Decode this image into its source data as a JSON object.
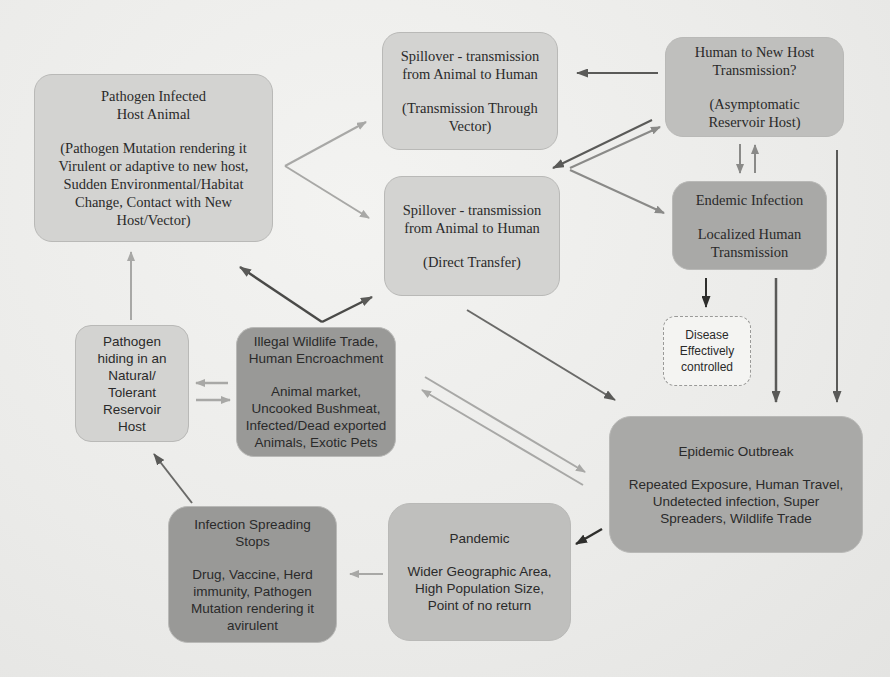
{
  "diagram": {
    "nodes": {
      "host_animal": {
        "title": [
          "Pathogen Infected",
          "Host Animal"
        ],
        "body": [
          "(Pathogen Mutation rendering it",
          "Virulent or adaptive to new host,",
          "Sudden Environmental/Habitat",
          "Change, Contact with New",
          "Host/Vector)"
        ]
      },
      "spillover_vector": {
        "title": [
          "Spillover - transmission",
          "from Animal to Human"
        ],
        "body": [
          "(Transmission Through",
          "Vector)"
        ]
      },
      "human_to_new_host": {
        "title": [
          "Human to New Host",
          "Transmission?"
        ],
        "body": [
          "(Asymptomatic",
          "Reservoir Host)"
        ]
      },
      "spillover_direct": {
        "title": [
          "Spillover - transmission",
          "from Animal to Human"
        ],
        "body": [
          "(Direct Transfer)"
        ]
      },
      "endemic": {
        "title": [
          "Endemic Infection"
        ],
        "body": [
          "Localized Human",
          "Transmission"
        ]
      },
      "reservoir_host": {
        "title": [
          "Pathogen",
          "hiding in an",
          "Natural/",
          "Tolerant",
          "Reservoir",
          "Host"
        ]
      },
      "illegal_trade": {
        "title": [
          "Illegal Wildlife Trade,",
          "Human Encroachment"
        ],
        "body": [
          "Animal market,",
          "Uncooked Bushmeat,",
          "Infected/Dead exported",
          "Animals, Exotic Pets"
        ]
      },
      "controlled": {
        "title": [
          "Disease",
          "Effectively",
          "controlled"
        ]
      },
      "epidemic": {
        "title": [
          "Epidemic Outbreak"
        ],
        "body": [
          "Repeated Exposure, Human Travel,",
          "Undetected infection, Super",
          "Spreaders, Wildlife Trade"
        ]
      },
      "pandemic": {
        "title": [
          "Pandemic"
        ],
        "body": [
          "Wider Geographic Area,",
          "High Population Size,",
          "Point of no return"
        ]
      },
      "spreading_stops": {
        "title": [
          "Infection Spreading",
          "Stops"
        ],
        "body": [
          "Drug, Vaccine, Herd",
          "immunity, Pathogen",
          "Mutation rendering it",
          "avirulent"
        ]
      }
    },
    "edges": [
      {
        "from": "host_animal",
        "to": "spillover_vector",
        "shade": "light"
      },
      {
        "from": "host_animal",
        "to": "spillover_direct",
        "shade": "light"
      },
      {
        "from": "human_to_new_host",
        "to": "spillover_vector",
        "shade": "dark"
      },
      {
        "from": "human_to_new_host",
        "to": "spillover_direct",
        "shade": "dark"
      },
      {
        "from": "spillover_direct",
        "to": "human_to_new_host",
        "shade": "mid"
      },
      {
        "from": "spillover_direct",
        "to": "endemic",
        "shade": "mid"
      },
      {
        "from": "human_to_new_host",
        "to": "endemic",
        "shade": "mid"
      },
      {
        "from": "endemic",
        "to": "human_to_new_host",
        "shade": "mid"
      },
      {
        "from": "human_to_new_host",
        "to": "epidemic",
        "shade": "dark"
      },
      {
        "from": "endemic",
        "to": "controlled",
        "shade": "dark"
      },
      {
        "from": "endemic",
        "to": "epidemic",
        "shade": "dark"
      },
      {
        "from": "illegal_trade",
        "to": "host_animal",
        "shade": "dark"
      },
      {
        "from": "illegal_trade",
        "to": "spillover_direct",
        "shade": "dark"
      },
      {
        "from": "spillover_direct",
        "to": "epidemic",
        "shade": "dark"
      },
      {
        "from": "illegal_trade",
        "to": "epidemic",
        "shade": "light"
      },
      {
        "from": "epidemic",
        "to": "illegal_trade",
        "shade": "light"
      },
      {
        "from": "illegal_trade",
        "to": "reservoir_host",
        "shade": "light"
      },
      {
        "from": "reservoir_host",
        "to": "illegal_trade",
        "shade": "light"
      },
      {
        "from": "reservoir_host",
        "to": "host_animal",
        "shade": "light"
      },
      {
        "from": "epidemic",
        "to": "pandemic",
        "shade": "darkest"
      },
      {
        "from": "pandemic",
        "to": "spreading_stops",
        "shade": "light"
      },
      {
        "from": "spreading_stops",
        "to": "reservoir_host",
        "shade": "dark"
      }
    ],
    "colors": {
      "background": "#ededeb",
      "node_light": "#d3d3d1",
      "node_mid": "#bfbfbd",
      "node_dark": "#a9a9a7",
      "node_darker": "#999997",
      "arrow_light": "#a8a8a6",
      "arrow_mid": "#8a8a88",
      "arrow_dark": "#5a5a58",
      "arrow_darkest": "#2e2e2c"
    }
  }
}
